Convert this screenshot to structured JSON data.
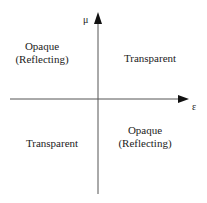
{
  "diagram": {
    "axes": {
      "x_label": "ε",
      "y_label": "μ"
    },
    "quadrants": {
      "top_left": {
        "line1": "Opaque",
        "line2": "(Reflecting)"
      },
      "top_right": {
        "line1": "Transparent"
      },
      "bottom_left": {
        "line1": "Transparent"
      },
      "bottom_right": {
        "line1": "Opaque",
        "line2": "(Reflecting)"
      }
    }
  }
}
